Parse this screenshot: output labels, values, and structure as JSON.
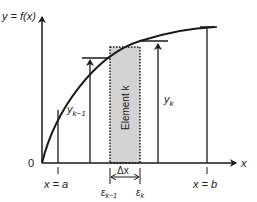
{
  "diagram": {
    "y_axis_label": "y = f(x)",
    "x_axis_label": "x",
    "origin_label": "0",
    "x_a_label": "x = a",
    "x_b_label": "x = b",
    "y_km1_label": "y",
    "y_km1_sub": "k−1",
    "y_k_label": "y",
    "y_k_sub": "k",
    "element_label": "Element k",
    "delta_x_label": "Δx",
    "eps_km1_label": "ε",
    "eps_km1_sub": "k−1",
    "eps_k_label": "ε",
    "eps_k_sub": "k",
    "colors": {
      "line": "#1a1a1a",
      "element_fill": "#d3d3d3"
    }
  }
}
